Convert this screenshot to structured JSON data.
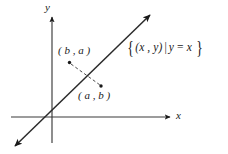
{
  "figure": {
    "kind": "cartesian-diagram",
    "background_color": "#ffffff",
    "ink_color": "#1a1a1a",
    "axes": {
      "x_label": "x",
      "y_label": "y",
      "origin": {
        "x": 52,
        "y": 117
      }
    },
    "line": {
      "label": "identity-line",
      "equation": "y = x",
      "from": {
        "x": 13,
        "y": 148
      },
      "to": {
        "x": 152,
        "y": 13
      }
    },
    "points": [
      {
        "name": "point-ba",
        "label": "( b ,  a )",
        "label_parts": {
          "open": "(",
          "first": "b",
          "comma": ",",
          "second": "a",
          "close": ")"
        },
        "dot": {
          "x": 70,
          "y": 63
        }
      },
      {
        "name": "point-ab",
        "label": "( a ,  b )",
        "label_parts": {
          "open": "(",
          "first": "a",
          "comma": ",",
          "second": "b",
          "close": ")"
        },
        "dot": {
          "x": 101,
          "y": 86
        }
      }
    ],
    "connector": {
      "name": "reflection-connector",
      "style": "dashed",
      "from": {
        "x": 70,
        "y": 63
      },
      "to": {
        "x": 101,
        "y": 86
      }
    },
    "set_notation": {
      "open_brace": "{",
      "tuple": "(x , y)",
      "separator": "|",
      "condition_lhs": "y",
      "condition_op": "=",
      "condition_rhs": "x",
      "close_brace": "}",
      "full": "{(x , y) | y = x}"
    }
  }
}
